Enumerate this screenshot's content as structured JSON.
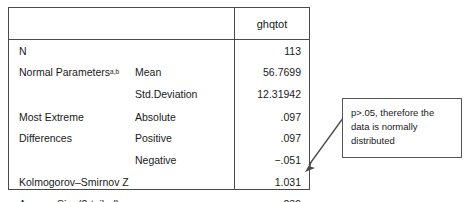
{
  "table": {
    "header": {
      "empty_label": "",
      "variable_label": "ghqtot"
    },
    "rows": [
      {
        "label": "N",
        "label_sup": "",
        "sublabel": "",
        "value": "113"
      },
      {
        "label": "Normal Parameters",
        "label_sup": "a,b",
        "sublabel": "Mean",
        "value": "56.7699"
      },
      {
        "label": "",
        "label_sup": "",
        "sublabel": "Std.Deviation",
        "value": "12.31942"
      },
      {
        "label": "Most Extreme",
        "label_sup": "",
        "sublabel": "Absolute",
        "value": ".097"
      },
      {
        "label": "Differences",
        "label_sup": "",
        "sublabel": "Positive",
        "value": ".097"
      },
      {
        "label": "",
        "label_sup": "",
        "sublabel": "Negative",
        "value": "−.051"
      },
      {
        "label": "Kolmogorov–Smirnov Z",
        "label_sup": "",
        "sublabel": "",
        "value": "1.031"
      },
      {
        "label": "Asymp. Sig. (2-tailed)",
        "label_sup": "",
        "sublabel": "",
        "value": ".239"
      }
    ]
  },
  "annotation": {
    "text": "p>.05, therefore the data is normally distributed"
  },
  "colors": {
    "border": "#4a4a4a",
    "annotation_border": "#555555",
    "text": "#1a1a1a",
    "background": "#ffffff"
  }
}
